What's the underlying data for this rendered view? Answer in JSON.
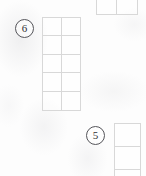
{
  "canvas": {
    "width": 146,
    "height": 176,
    "background": "#fdfdfd"
  },
  "style": {
    "grid_line_color": "#d8d8d8",
    "badge_border_color": "#55555a",
    "badge_text_color": "#2e2e33"
  },
  "badges": [
    {
      "id": "badge-6",
      "label": "6",
      "x": 15,
      "y": 19
    },
    {
      "id": "badge-5",
      "label": "5",
      "x": 86,
      "y": 126
    }
  ],
  "grids": [
    {
      "id": "grid-top",
      "name": "top-partial-grid",
      "columns": 2,
      "rows": 1,
      "clipped": "top",
      "cells": [
        "",
        ""
      ]
    },
    {
      "id": "grid-main",
      "name": "main-grid",
      "columns": 2,
      "rows": 5,
      "clipped": "none",
      "cells": [
        "",
        "",
        "",
        "",
        "",
        "",
        "",
        "",
        "",
        ""
      ]
    },
    {
      "id": "grid-bottom",
      "name": "bottom-partial-grid",
      "columns": 1,
      "rows": 3,
      "clipped": "bottom",
      "cells": [
        "",
        "",
        ""
      ]
    }
  ]
}
